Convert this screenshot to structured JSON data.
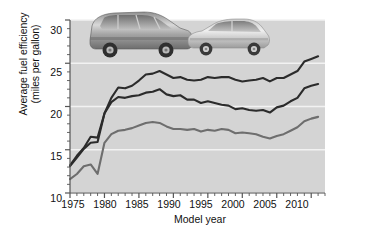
{
  "figure": {
    "background_color": "#ffffff",
    "panel_color": "#d4d4d4",
    "gridline_color": "#f2f2f2",
    "axis_color": "#555555",
    "line_color_dark": "#2b2b2b",
    "line_color_mid": "#6e6e6e"
  },
  "axes": {
    "y_title_line1": "Average fuel efficiency",
    "y_title_line2": "(miles per gallon)",
    "x_title": "Model year",
    "y_ticks": [
      "10",
      "15",
      "20",
      "25",
      "30"
    ],
    "x_ticks": [
      "1975",
      "1980",
      "1985",
      "1990",
      "1995",
      "2000",
      "2005",
      "2010"
    ]
  },
  "series_labels": {
    "cars": "Cars",
    "both": "Both cars and trucks",
    "trucks": "Trucks"
  },
  "photo": {
    "alt": "photo of an SUV and a sedan",
    "suv_label": "suv-photo",
    "sedan_label": "sedan-photo"
  },
  "chart_data": {
    "type": "line",
    "title": "",
    "xlabel": "Model year",
    "ylabel": "Average fuel efficiency (miles per gallon)",
    "xlim": [
      1975,
      2012
    ],
    "ylim": [
      10,
      30
    ],
    "yticks": [
      10,
      15,
      20,
      25,
      30
    ],
    "xticks": [
      1975,
      1980,
      1985,
      1990,
      1995,
      2000,
      2005,
      2010
    ],
    "grid": true,
    "grid_axis": "y",
    "legend": "inline-labels",
    "x": [
      1975,
      1976,
      1977,
      1978,
      1979,
      1980,
      1981,
      1982,
      1983,
      1984,
      1985,
      1986,
      1987,
      1988,
      1989,
      1990,
      1991,
      1992,
      1993,
      1994,
      1995,
      1996,
      1997,
      1998,
      1999,
      2000,
      2001,
      2002,
      2003,
      2004,
      2005,
      2006,
      2007,
      2008,
      2009,
      2010,
      2011
    ],
    "series": [
      {
        "name": "Cars",
        "color": "#2b2b2b",
        "values": [
          13.2,
          14.3,
          15.2,
          16.5,
          16.4,
          19.2,
          21.0,
          22.2,
          22.1,
          22.4,
          23.0,
          23.7,
          23.8,
          24.1,
          23.7,
          23.3,
          23.4,
          23.1,
          23.0,
          23.1,
          23.4,
          23.3,
          23.4,
          23.4,
          23.1,
          22.9,
          23.0,
          23.1,
          23.3,
          22.9,
          23.3,
          23.3,
          23.7,
          24.1,
          25.2,
          25.5,
          25.8
        ]
      },
      {
        "name": "Both cars and trucks",
        "color": "#2b2b2b",
        "values": [
          13.1,
          14.1,
          15.1,
          15.8,
          15.9,
          19.2,
          20.5,
          21.1,
          21.0,
          21.2,
          21.3,
          21.6,
          21.7,
          22.0,
          21.4,
          21.2,
          21.3,
          20.8,
          20.8,
          20.4,
          20.6,
          20.4,
          20.2,
          20.1,
          19.7,
          19.8,
          19.6,
          19.5,
          19.6,
          19.3,
          19.9,
          20.1,
          20.6,
          21.0,
          22.1,
          22.4,
          22.6
        ]
      },
      {
        "name": "Trucks",
        "color": "#6e6e6e",
        "values": [
          11.6,
          12.2,
          13.1,
          13.3,
          12.2,
          15.8,
          16.8,
          17.2,
          17.3,
          17.5,
          17.8,
          18.1,
          18.2,
          18.1,
          17.7,
          17.4,
          17.4,
          17.3,
          17.4,
          17.1,
          17.3,
          17.2,
          17.4,
          17.3,
          16.9,
          17.0,
          16.9,
          16.8,
          16.5,
          16.3,
          16.6,
          16.8,
          17.2,
          17.6,
          18.3,
          18.6,
          18.8
        ]
      }
    ]
  }
}
